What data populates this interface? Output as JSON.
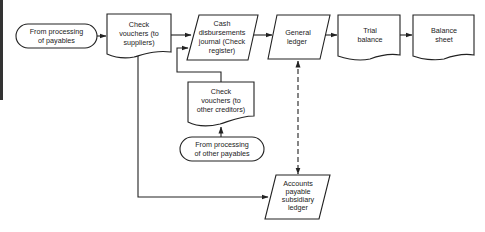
{
  "diagram": {
    "type": "flowchart",
    "nodes": {
      "from_payables": {
        "shape": "terminal",
        "lines": [
          "From processing",
          "of payables"
        ]
      },
      "check_vouchers_suppliers": {
        "shape": "document",
        "lines": [
          "Check",
          "vouchers (to",
          "suppliers)"
        ]
      },
      "cash_disbursements_journal": {
        "shape": "parallelogram",
        "lines": [
          "Cash",
          "disbursements",
          "journal (Check",
          "register)"
        ]
      },
      "general_ledger": {
        "shape": "parallelogram",
        "lines": [
          "General",
          "ledger"
        ]
      },
      "trial_balance": {
        "shape": "document",
        "lines": [
          "Trial",
          "balance"
        ]
      },
      "balance_sheet": {
        "shape": "document",
        "lines": [
          "Balance",
          "sheet"
        ]
      },
      "check_vouchers_other": {
        "shape": "document",
        "lines": [
          "Check",
          "vouchers (to",
          "other creditors)"
        ]
      },
      "from_other_payables": {
        "shape": "terminal",
        "lines": [
          "From processing",
          "of other payables"
        ]
      },
      "ap_subsidiary_ledger": {
        "shape": "parallelogram",
        "lines": [
          "Accounts",
          "payable",
          "subsidiary",
          "ledger"
        ]
      }
    },
    "edges": [
      {
        "from": "From processing of payables",
        "to": "Check vouchers (to suppliers)",
        "style": "solid"
      },
      {
        "from": "Check vouchers (to suppliers)",
        "to": "Cash disbursements journal (Check register)",
        "style": "solid"
      },
      {
        "from": "Cash disbursements journal (Check register)",
        "to": "General ledger",
        "style": "solid"
      },
      {
        "from": "General ledger",
        "to": "Trial balance",
        "style": "solid"
      },
      {
        "from": "Trial balance",
        "to": "Balance sheet",
        "style": "solid"
      },
      {
        "from": "From processing of other payables",
        "to": "Check vouchers (to other creditors)",
        "style": "solid"
      },
      {
        "from": "Check vouchers (to other creditors)",
        "to": "Cash disbursements journal (Check register)",
        "style": "solid"
      },
      {
        "from": "Check vouchers (to suppliers)",
        "to": "Accounts payable subsidiary ledger",
        "style": "solid"
      },
      {
        "from": "General ledger",
        "to": "Accounts payable subsidiary ledger",
        "style": "dashed-bidirectional"
      }
    ]
  }
}
